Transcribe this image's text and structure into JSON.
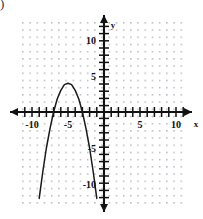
{
  "figure": {
    "corner_mark": ")",
    "axis_label_x": "x",
    "axis_label_y": "y",
    "background_color": "#ffffff",
    "axis_color": "#111111",
    "grid_dot_color": "#b9b9c4",
    "curve_color": "#1a1a1a"
  },
  "chart_data": {
    "type": "line",
    "title": "",
    "subtitle": "",
    "xlabel": "x",
    "ylabel": "y",
    "grid": "dotted",
    "legend": "none",
    "xlim": [
      -12,
      12
    ],
    "ylim": [
      -13,
      13
    ],
    "x_tick_labels": [
      "-10",
      "-5",
      "5",
      "10"
    ],
    "x_tick_values": [
      -10,
      -5,
      5,
      10
    ],
    "y_tick_labels": [
      "10",
      "5",
      "-5",
      "-10"
    ],
    "y_tick_values": [
      10,
      5,
      -5,
      -10
    ],
    "tick_interval": 1,
    "series": [
      {
        "name": "parabola",
        "equation": "y = -x^2 - 10x - 21",
        "vertex": [
          -5,
          4
        ],
        "x_intercepts": [
          -9.6,
          -0.4
        ],
        "opens": "down",
        "x": [
          -12.1,
          -11.5,
          -11,
          -10.5,
          -10,
          -9.5,
          -9,
          -8.5,
          -8,
          -7.5,
          -7,
          -6.5,
          -6,
          -5.5,
          -5,
          -4.5,
          -4,
          -3.5,
          -3,
          -2.5,
          -2,
          -1.5,
          -1,
          -0.5,
          0,
          0.5,
          1,
          1.5,
          2,
          2.5,
          3,
          3.5,
          4,
          4.2
        ],
        "y": [
          -47.6,
          -38.3,
          -32,
          -26.3,
          -21,
          -16.3,
          -12,
          -8.3,
          -5,
          -2.3,
          0,
          1.8,
          3,
          3.8,
          4,
          3.8,
          3,
          1.8,
          0,
          -2.3,
          -5,
          -8.3,
          -12,
          -16.3,
          -21,
          -26.3,
          -32,
          -38.3,
          -45,
          -52.3,
          -60,
          -68.3,
          -77,
          -81.2
        ]
      }
    ]
  }
}
